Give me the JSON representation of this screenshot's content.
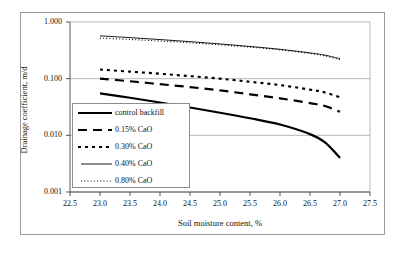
{
  "chart_data": {
    "type": "line",
    "title": "",
    "xlabel": "Soil moisture content,  %",
    "ylabel": "Drainage coefficient,  m/d",
    "xlim": [
      22.5,
      27.5
    ],
    "ylim": [
      0.001,
      1.0
    ],
    "yscale": "log",
    "grid": "horizontal",
    "legend_position": "inside-left",
    "xticks": [
      "22.5",
      "23.0",
      "23.5",
      "24.0",
      "24.5",
      "25.0",
      "25.5",
      "26.0",
      "26.5",
      "27.0",
      "27.5"
    ],
    "yticks": [
      "1.000",
      "0.100",
      "0.010",
      "0.001"
    ],
    "x": [
      23.0,
      23.5,
      24.0,
      24.5,
      25.0,
      25.5,
      26.0,
      26.5,
      26.75,
      27.0
    ],
    "series": [
      {
        "name": "control backfill",
        "style": "solid-thick",
        "values": [
          0.055,
          0.046,
          0.038,
          0.031,
          0.025,
          0.02,
          0.0155,
          0.0105,
          0.0075,
          0.004
        ]
      },
      {
        "name": "0.15% CaO",
        "style": "long-dash",
        "values": [
          0.1,
          0.09,
          0.08,
          0.071,
          0.062,
          0.053,
          0.045,
          0.037,
          0.033,
          0.026
        ]
      },
      {
        "name": "0.30% CaO",
        "style": "short-dash",
        "values": [
          0.145,
          0.133,
          0.122,
          0.111,
          0.1,
          0.088,
          0.077,
          0.064,
          0.057,
          0.047
        ]
      },
      {
        "name": "0.40% CaO",
        "style": "solid-thin",
        "values": [
          0.57,
          0.53,
          0.49,
          0.45,
          0.41,
          0.37,
          0.33,
          0.285,
          0.26,
          0.225
        ]
      },
      {
        "name": "0.80% CaO",
        "style": "dotted",
        "values": [
          0.52,
          0.492,
          0.462,
          0.43,
          0.396,
          0.36,
          0.322,
          0.278,
          0.252,
          0.215
        ]
      }
    ]
  },
  "legend": {
    "items": [
      {
        "label": "control backfill"
      },
      {
        "label": "0.15% CaO"
      },
      {
        "label": "0.30% CaO"
      },
      {
        "label": "0.40% CaO"
      },
      {
        "label": "0.80% CaO"
      }
    ]
  },
  "colors": {
    "line": "#000000",
    "grid": "#9a9a9a",
    "axis": "#555555",
    "frame": "#9a9a9a",
    "text": "#111111",
    "background": "#ffffff"
  }
}
